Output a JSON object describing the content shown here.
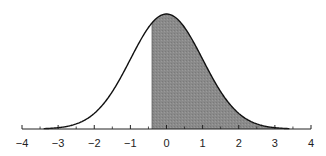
{
  "chart_data": {
    "type": "area",
    "title": "",
    "xlabel": "",
    "ylabel": "",
    "distribution": {
      "name": "standard normal",
      "mean": 0,
      "sd": 1
    },
    "curve_x_range": [
      -3.4,
      3.4
    ],
    "shaded_region": {
      "from": -0.4,
      "to": 3.4,
      "color": "#8a8a8a"
    },
    "xlim": [
      -4,
      4
    ],
    "major_ticks": [
      -4,
      -3,
      -2,
      -1,
      0,
      1,
      2,
      3,
      4
    ],
    "minor_ticks": [
      -3.5,
      -2.5,
      -1.5,
      -0.5,
      0.5,
      1.5,
      2.5,
      3.5
    ],
    "tick_labels": [
      "−4",
      "−3",
      "−2",
      "−1",
      "0",
      "1",
      "2",
      "3",
      "4"
    ],
    "grid": false,
    "legend": null,
    "colors": {
      "line": "#111111",
      "fill": "#8a8a8a",
      "axis": "#222222"
    }
  }
}
